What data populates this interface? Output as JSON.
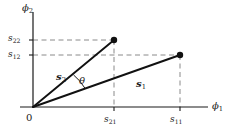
{
  "figure": {
    "type": "vector-diagram",
    "background_color": "#ffffff",
    "line_color": "#1a1a1a",
    "dash_color": "#8a8a8a",
    "point_color": "#111111"
  },
  "axes": {
    "x": {
      "label": "ϕ",
      "label_sub": "1",
      "origin_px": {
        "x": 33,
        "y": 107
      },
      "end_px": {
        "x": 208,
        "y": 107
      },
      "ticks": [
        {
          "id": "s21",
          "label": "s",
          "label_sub": "21",
          "x_px": 114
        },
        {
          "id": "s11",
          "label": "s",
          "label_sub": "11",
          "x_px": 180
        }
      ]
    },
    "y": {
      "label": "ϕ",
      "label_sub": "2",
      "origin_px": {
        "x": 33,
        "y": 107
      },
      "end_px": {
        "x": 33,
        "y": 12
      },
      "ticks": [
        {
          "id": "s22",
          "label": "s",
          "label_sub": "22",
          "y_px": 40
        },
        {
          "id": "s12",
          "label": "s",
          "label_sub": "12",
          "y_px": 55
        }
      ]
    },
    "origin_label": "0"
  },
  "vectors": [
    {
      "id": "s1",
      "label": "s",
      "label_sub": "1",
      "from_px": {
        "x": 33,
        "y": 107
      },
      "to_px": {
        "x": 180,
        "y": 55
      },
      "components": {
        "x_tick": "s11",
        "y_tick": "s12"
      }
    },
    {
      "id": "s2",
      "label": "s",
      "label_sub": "2",
      "from_px": {
        "x": 33,
        "y": 107
      },
      "to_px": {
        "x": 114,
        "y": 40
      },
      "components": {
        "x_tick": "s21",
        "y_tick": "s22"
      }
    }
  ],
  "angle": {
    "id": "theta",
    "label": "θ",
    "between": [
      "s2",
      "s1"
    ],
    "arc_radius_px": 52
  },
  "dashed_guides": [
    {
      "id": "guide-s22",
      "orientation": "horizontal",
      "from_px": {
        "x": 33,
        "y": 40
      },
      "to_px": {
        "x": 114,
        "y": 40
      }
    },
    {
      "id": "guide-s12",
      "orientation": "horizontal",
      "from_px": {
        "x": 33,
        "y": 55
      },
      "to_px": {
        "x": 180,
        "y": 55
      }
    },
    {
      "id": "guide-s21",
      "orientation": "vertical",
      "from_px": {
        "x": 114,
        "y": 40
      },
      "to_px": {
        "x": 114,
        "y": 107
      }
    },
    {
      "id": "guide-s11",
      "orientation": "vertical",
      "from_px": {
        "x": 180,
        "y": 55
      },
      "to_px": {
        "x": 180,
        "y": 107
      }
    }
  ]
}
